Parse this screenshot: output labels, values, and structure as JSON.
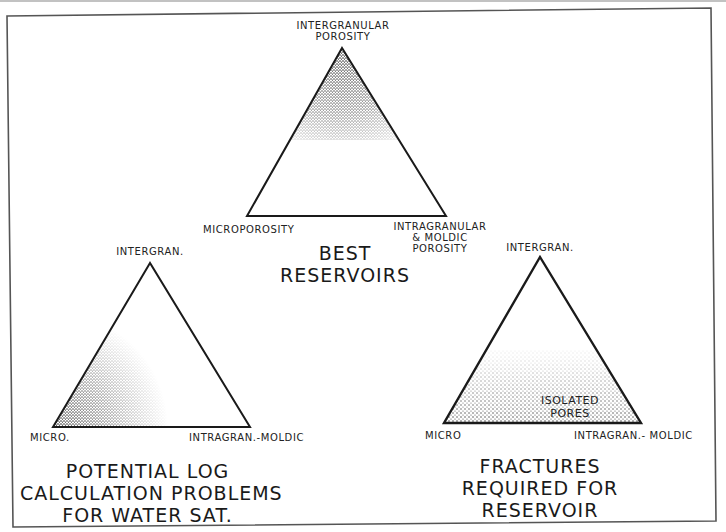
{
  "diagrams": [
    {
      "id": "best",
      "vertices": {
        "top": "INTERGRANULAR POROSITY",
        "left": "MICROPOROSITY",
        "right": "INTRAGRANULAR & MOLDIC POROSITY"
      },
      "top_label_lines": [
        "INTERGRANULAR",
        "POROSITY"
      ],
      "left_label": "MICROPOROSITY",
      "right_label_lines": [
        "INTRAGRANULAR",
        "& MOLDIC",
        "POROSITY"
      ],
      "caption_lines": [
        "BEST",
        "RESERVOIRS"
      ],
      "shaded_region": "near intergranular apex"
    },
    {
      "id": "log-problems",
      "top_label": "INTERGRAN.",
      "left_label": "MICRO.",
      "right_label": "INTRAGRAN.-MOLDIC",
      "caption_lines": [
        "POTENTIAL LOG",
        "CALCULATION PROBLEMS",
        "FOR WATER SAT."
      ],
      "shaded_region": "near micro corner"
    },
    {
      "id": "fractures",
      "top_label": "INTERGRAN.",
      "left_label": "MICRO",
      "right_label": "INTRAGRAN.- MOLDIC",
      "inner_label_lines": [
        "ISOLATED",
        "PORES"
      ],
      "caption_lines": [
        "FRACTURES",
        "REQUIRED FOR",
        "RESERVOIR"
      ],
      "shaded_region": "lower band along micro / intragran.-moldic base"
    }
  ],
  "colors": {
    "ink": "#1a1a1a",
    "frame": "#555555",
    "paper": "#ffffff"
  }
}
